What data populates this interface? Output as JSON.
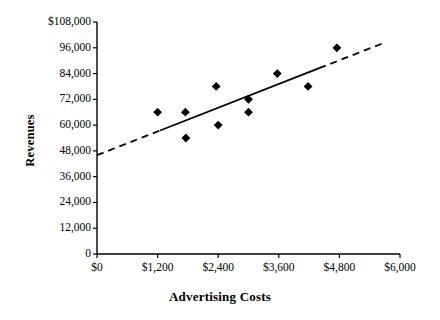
{
  "chart_data": {
    "type": "scatter",
    "title": "",
    "xlabel": "Advertising Costs",
    "ylabel": "Revenues",
    "xlim": [
      0,
      6000
    ],
    "ylim": [
      0,
      108000
    ],
    "grid": false,
    "legend": "none",
    "x_tick_labels": [
      "$0",
      "$1,200",
      "$2,400",
      "$3,600",
      "$4,800",
      "$6,000"
    ],
    "x_tick_values": [
      0,
      1200,
      2400,
      3600,
      4800,
      6000
    ],
    "y_tick_labels": [
      "$108,000",
      "96,000",
      "84,000",
      "72,000",
      "60,000",
      "48,000",
      "36,000",
      "24,000",
      "12,000",
      "0"
    ],
    "y_tick_values": [
      108000,
      96000,
      84000,
      72000,
      60000,
      48000,
      36000,
      24000,
      12000,
      0
    ],
    "series": [
      {
        "name": "Observations",
        "marker": "diamond",
        "color": "#000000",
        "points": [
          {
            "x": 1200,
            "y": 66000
          },
          {
            "x": 1750,
            "y": 66000
          },
          {
            "x": 1760,
            "y": 54000
          },
          {
            "x": 2360,
            "y": 78000
          },
          {
            "x": 2400,
            "y": 60000
          },
          {
            "x": 3000,
            "y": 72000
          },
          {
            "x": 3000,
            "y": 66000
          },
          {
            "x": 3570,
            "y": 84000
          },
          {
            "x": 4180,
            "y": 78000
          },
          {
            "x": 4750,
            "y": 96000
          }
        ]
      },
      {
        "name": "Trend line",
        "type": "line",
        "color": "#000000",
        "style": "solid-center-dashed-ends",
        "x_start": 0,
        "y_start": 46000,
        "x_end": 5650,
        "y_end": 98000,
        "solid_x_start": 1250,
        "solid_x_end": 4400
      }
    ]
  },
  "axis_titles": {
    "x": "Advertising Costs",
    "y": "Revenues"
  }
}
